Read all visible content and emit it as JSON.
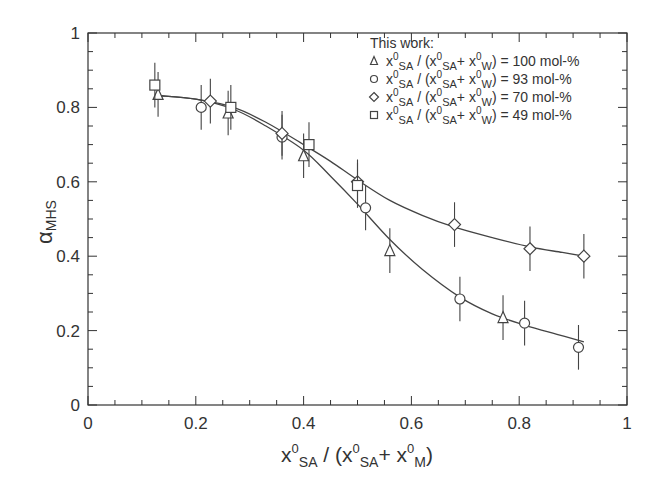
{
  "chart_data": {
    "type": "scatter",
    "title": "",
    "xlabel": "x0SA / (x0SA+ x0M)",
    "xlabel_parts": {
      "x": "x",
      "sup": "0",
      "sub_sa": "SA",
      "slash": " / (",
      "sub_m": "M",
      "plus": "+ ",
      "close": ")"
    },
    "ylabel": "αMHS",
    "ylabel_parts": {
      "alpha": "α",
      "sub": "MHS"
    },
    "xlim": [
      0,
      1
    ],
    "ylim": [
      0,
      1
    ],
    "x_ticks": [
      "0",
      "0.2",
      "0.4",
      "0.6",
      "0.8",
      "1"
    ],
    "y_ticks": [
      "0",
      "0.2",
      "0.4",
      "0.6",
      "0.8",
      "1"
    ],
    "grid": false,
    "legend_position": "upper right",
    "legend_title": "This work:",
    "series": [
      {
        "name": "x0SA / (x0SA+ x0W) = 100 mol-%",
        "value_label": "100 mol-%",
        "marker": "triangle",
        "x": [
          0.13,
          0.26,
          0.4,
          0.56,
          0.77
        ],
        "y": [
          0.835,
          0.785,
          0.67,
          0.415,
          0.235
        ],
        "yerr": 0.06
      },
      {
        "name": "x0SA / (x0SA+ x0W) = 93 mol-%",
        "value_label": "93 mol-%",
        "marker": "circle",
        "x": [
          0.21,
          0.36,
          0.515,
          0.69,
          0.81,
          0.91
        ],
        "y": [
          0.8,
          0.72,
          0.53,
          0.285,
          0.22,
          0.155
        ],
        "yerr": 0.06
      },
      {
        "name": "x0SA / (x0SA+ x0W) = 70 mol-%",
        "value_label": "70 mol-%",
        "marker": "diamond",
        "x": [
          0.227,
          0.36,
          0.5,
          0.68,
          0.82,
          0.92
        ],
        "y": [
          0.817,
          0.73,
          0.6,
          0.485,
          0.42,
          0.4
        ],
        "yerr": 0.06
      },
      {
        "name": "x0SA / (x0SA+ x0W) = 49 mol-%",
        "value_label": "49 mol-%",
        "marker": "square",
        "x": [
          0.124,
          0.265,
          0.41,
          0.5
        ],
        "y": [
          0.86,
          0.8,
          0.7,
          0.59
        ],
        "yerr": 0.06
      }
    ],
    "fit_curves": [
      {
        "name": "upper fit (70 mol-%)",
        "x": [
          0.13,
          0.2,
          0.27,
          0.33,
          0.4,
          0.45,
          0.5,
          0.56,
          0.62,
          0.68,
          0.75,
          0.82,
          0.88,
          0.92
        ],
        "y": [
          0.832,
          0.822,
          0.8,
          0.76,
          0.7,
          0.655,
          0.605,
          0.55,
          0.51,
          0.478,
          0.45,
          0.425,
          0.41,
          0.4
        ]
      },
      {
        "name": "lower fit (100/93 mol-%)",
        "x": [
          0.13,
          0.2,
          0.27,
          0.33,
          0.4,
          0.45,
          0.5,
          0.56,
          0.62,
          0.69,
          0.75,
          0.81,
          0.87,
          0.92
        ],
        "y": [
          0.832,
          0.822,
          0.795,
          0.75,
          0.685,
          0.615,
          0.54,
          0.445,
          0.365,
          0.29,
          0.245,
          0.215,
          0.19,
          0.17
        ]
      }
    ]
  },
  "legend": {
    "title": "This work:",
    "rows": [
      {
        "marker": "triangle",
        "value": "= 100 mol-%"
      },
      {
        "marker": "circle",
        "value": "=   93 mol-%"
      },
      {
        "marker": "diamond",
        "value": "=   70 mol-%"
      },
      {
        "marker": "square",
        "value": "=   49 mol-%"
      }
    ],
    "expr": {
      "x": "x",
      "sup": "0",
      "sa": "SA",
      "w": "W",
      "open": " / (",
      "plus": "+ ",
      "close": ")"
    }
  },
  "colors": {
    "axis": "#333333",
    "marker": "#444444",
    "curve": "#444444",
    "text": "#333333",
    "background": "#ffffff"
  }
}
